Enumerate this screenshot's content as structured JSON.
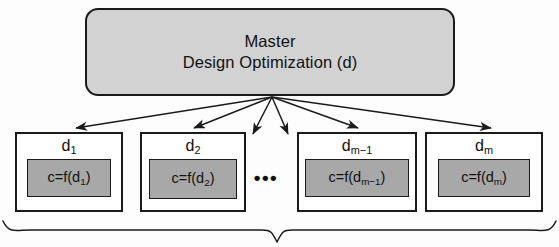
{
  "diagram": {
    "type": "hierarchical-decomposition",
    "master": {
      "title_line1": "Master",
      "title_line2": "Design Optimization (d)"
    },
    "ellipsis": "•••",
    "subproblems": [
      {
        "label": "d₁",
        "label_base": "d",
        "label_sub": "1",
        "formula_base": "c=f(d",
        "formula_sub": "1",
        "formula_close": ")"
      },
      {
        "label": "d₂",
        "label_base": "d",
        "label_sub": "2",
        "formula_base": "c=f(d",
        "formula_sub": "2",
        "formula_close": ")"
      },
      {
        "label": "dₘ₋₁",
        "label_base": "d",
        "label_sub": "m−1",
        "formula_base": "c=f(d",
        "formula_sub": "m−1",
        "formula_close": ")"
      },
      {
        "label": "dₘ",
        "label_base": "d",
        "label_sub": "m",
        "formula_base": "c=f(d",
        "formula_sub": "m",
        "formula_close": ")"
      }
    ],
    "colors": {
      "master_fill": "#d2d2d2",
      "sub_fill": "#ffffff",
      "inner_fill": "#a8a8a8",
      "stroke": "#1b1b1b",
      "background": "#fdfdfd"
    },
    "arrow_count": 6,
    "brace": "curly-brace-bottom"
  }
}
